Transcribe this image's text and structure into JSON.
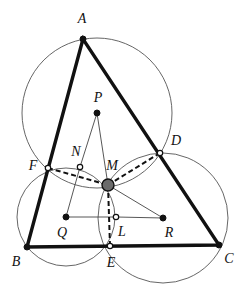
{
  "figure": {
    "width": 245,
    "height": 296,
    "background_color": "#ffffff"
  },
  "style": {
    "triangle_stroke": "#111111",
    "triangle_stroke_width": 3.4,
    "circle_stroke": "#555555",
    "circle_stroke_width": 0.9,
    "thin_stroke": "#444444",
    "thin_stroke_width": 0.9,
    "dashed_stroke": "#111111",
    "dashed_stroke_width": 2.0,
    "dash_pattern": "5,3",
    "node_fill_solid": "#111111",
    "node_fill_hollow": "#ffffff",
    "node_stroke": "#111111",
    "m_fill": "#6b6b6b",
    "m_stroke": "#111111",
    "label_color": "#111111"
  },
  "points": [
    {
      "id": "A",
      "label": "A",
      "x": 83,
      "y": 39,
      "label_x": 82,
      "label_y": 19,
      "marker": "solid",
      "r": 3.0
    },
    {
      "id": "B",
      "label": "B",
      "x": 27,
      "y": 247,
      "label_x": 16,
      "label_y": 262,
      "marker": "solid",
      "r": 3.0
    },
    {
      "id": "C",
      "label": "C",
      "x": 219,
      "y": 245,
      "label_x": 229,
      "label_y": 259,
      "marker": "solid",
      "r": 3.0
    },
    {
      "id": "D",
      "label": "D",
      "x": 160,
      "y": 153,
      "label_x": 176,
      "label_y": 141,
      "marker": "hollow",
      "r": 2.7
    },
    {
      "id": "E",
      "label": "E",
      "x": 110,
      "y": 246,
      "label_x": 111,
      "label_y": 263,
      "marker": "hollow",
      "r": 2.7
    },
    {
      "id": "F",
      "label": "F",
      "x": 48,
      "y": 168,
      "label_x": 33,
      "label_y": 166,
      "marker": "hollow",
      "r": 2.7
    },
    {
      "id": "P",
      "label": "P",
      "x": 97,
      "y": 113,
      "label_x": 98,
      "label_y": 98,
      "marker": "solid",
      "r": 3.0
    },
    {
      "id": "Q",
      "label": "Q",
      "x": 66,
      "y": 217,
      "label_x": 62,
      "label_y": 233,
      "marker": "solid",
      "r": 3.0
    },
    {
      "id": "R",
      "label": "R",
      "x": 163,
      "y": 218,
      "label_x": 169,
      "label_y": 233,
      "marker": "solid",
      "r": 3.0
    },
    {
      "id": "L",
      "label": "L",
      "x": 116,
      "y": 217,
      "label_x": 122,
      "label_y": 232,
      "marker": "hollow",
      "r": 2.7
    },
    {
      "id": "N",
      "label": "N",
      "x": 80,
      "y": 167,
      "label_x": 76,
      "label_y": 152,
      "marker": "hollow",
      "r": 2.7
    },
    {
      "id": "M",
      "label": "M",
      "x": 108,
      "y": 185,
      "label_x": 112,
      "label_y": 166,
      "marker": "big",
      "r": 6.0
    }
  ],
  "triangle": {
    "name": "ABC",
    "vertices": [
      "A",
      "B",
      "C"
    ],
    "path": "M 83 39 L 27 247 L 219 245 Z"
  },
  "circles": [
    {
      "id": "circle-P",
      "center": "P",
      "cx": 97,
      "cy": 113,
      "r": 75,
      "through": [
        "A",
        "F",
        "D",
        "M"
      ]
    },
    {
      "id": "circle-Q",
      "center": "Q",
      "cx": 66,
      "cy": 217,
      "r": 49,
      "through": [
        "B",
        "F",
        "E",
        "M"
      ]
    },
    {
      "id": "circle-R",
      "center": "R",
      "cx": 163,
      "cy": 218,
      "r": 65,
      "through": [
        "C",
        "D",
        "E",
        "M"
      ]
    }
  ],
  "thin_segments": [
    {
      "id": "seg-P-N",
      "from": "P",
      "to": "N",
      "path": "M 97 113 L 80 167"
    },
    {
      "id": "seg-N-Q",
      "from": "N",
      "to": "Q",
      "path": "M 80 167 L 66 217"
    },
    {
      "id": "seg-P-M",
      "from": "P",
      "to": "M",
      "path": "M 97 113 L 108 185"
    },
    {
      "id": "seg-M-R",
      "from": "M",
      "to": "R",
      "path": "M 108 185 L 163 218"
    },
    {
      "id": "seg-Q-L",
      "from": "Q",
      "to": "L",
      "path": "M 66 217 L 116 217"
    },
    {
      "id": "seg-L-R",
      "from": "L",
      "to": "R",
      "path": "M 116 217 L 163 218"
    }
  ],
  "dashed_segments": [
    {
      "id": "dash-F-M",
      "from": "F",
      "to": "M",
      "path": "M 48 168 L 108 185"
    },
    {
      "id": "dash-M-D",
      "from": "M",
      "to": "D",
      "path": "M 108 185 L 160 153"
    },
    {
      "id": "dash-M-E",
      "from": "M",
      "to": "E",
      "path": "M 108 185 L 110 246"
    }
  ],
  "labels_order": [
    "A",
    "P",
    "N",
    "M",
    "D",
    "F",
    "Q",
    "L",
    "R",
    "B",
    "E",
    "C"
  ]
}
